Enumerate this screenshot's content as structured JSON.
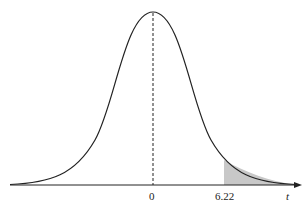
{
  "diagram": {
    "type": "t-distribution curve with shaded right tail",
    "center_label": "0",
    "critical_label": "6.22",
    "axis_label": "t",
    "shade_color": "#c8c8c8",
    "line_color": "#222222"
  }
}
